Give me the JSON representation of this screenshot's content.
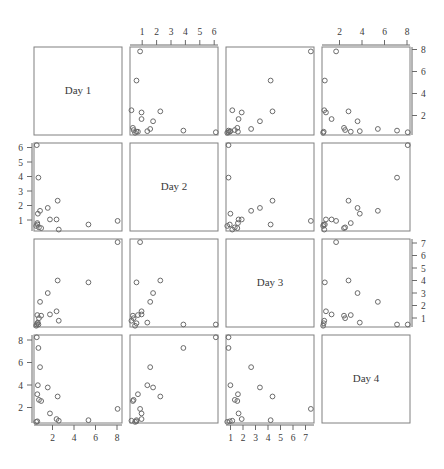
{
  "figure": {
    "title": "",
    "variables": [
      "Day 1",
      "Day 2",
      "Day 3",
      "Day 4"
    ],
    "background_color": "#ffffff",
    "frame_color": "#808080",
    "point_color": "#6b6b6b",
    "text_color": "#3a3a3a"
  },
  "chart_data": {
    "type": "scatter",
    "plot_kind": "scatterplot-matrix",
    "title": "",
    "xlabel": "",
    "ylabel": "",
    "grid": false,
    "legend": null,
    "variables": [
      "Day 1",
      "Day 2",
      "Day 3",
      "Day 4"
    ],
    "axis_ranges": {
      "Day 1": [
        0.3,
        8.3
      ],
      "Day 2": [
        0.5,
        6.6
      ],
      "Day 3": [
        0.6,
        7.6
      ],
      "Day 4": [
        0.5,
        8.3
      ]
    },
    "tick_labels": {
      "Day 1": [
        "2",
        "4",
        "6",
        "8"
      ],
      "Day 2": [
        "1",
        "2",
        "3",
        "4",
        "5",
        "6"
      ],
      "Day 3": [
        "1",
        "2",
        "3",
        "4",
        "5",
        "6",
        "7"
      ],
      "Day 4": [
        "2",
        "4",
        "6",
        "8"
      ]
    },
    "tick_values": {
      "Day 1": [
        2,
        4,
        6,
        8
      ],
      "Day 2": [
        1,
        2,
        3,
        4,
        5,
        6
      ],
      "Day 3": [
        1,
        2,
        3,
        4,
        5,
        6,
        7
      ],
      "Day 4": [
        2,
        4,
        6,
        8
      ]
    },
    "axis_placement": {
      "row_1": "right",
      "row_2": "left",
      "row_3": "right",
      "row_4": "left",
      "col_1": "bottom",
      "col_2": "top",
      "col_3": "bottom",
      "col_4": "top"
    },
    "observations": [
      {
        "Day 1": 0.55,
        "Day 2": 6.45,
        "Day 3": 0.8,
        "Day 4": 8.1
      },
      {
        "Day 1": 0.7,
        "Day 2": 4.2,
        "Day 3": 0.8,
        "Day 4": 7.15
      },
      {
        "Day 1": 0.85,
        "Day 2": 1.9,
        "Day 3": 2.6,
        "Day 4": 5.45
      },
      {
        "Day 1": 0.65,
        "Day 2": 1.7,
        "Day 3": 0.95,
        "Day 4": 3.85
      },
      {
        "Day 1": 1.55,
        "Day 2": 2.1,
        "Day 3": 3.3,
        "Day 4": 3.65
      },
      {
        "Day 1": 0.6,
        "Day 2": 1.05,
        "Day 3": 1.55,
        "Day 4": 3.05
      },
      {
        "Day 1": 0.75,
        "Day 2": 0.75,
        "Day 3": 1.3,
        "Day 4": 2.55
      },
      {
        "Day 1": 0.95,
        "Day 2": 0.7,
        "Day 3": 1.5,
        "Day 4": 2.45
      },
      {
        "Day 1": 2.45,
        "Day 2": 2.6,
        "Day 3": 4.3,
        "Day 4": 2.85
      },
      {
        "Day 1": 1.75,
        "Day 2": 1.3,
        "Day 3": 1.6,
        "Day 4": 1.35
      },
      {
        "Day 1": 2.35,
        "Day 2": 1.3,
        "Day 3": 1.85,
        "Day 4": 0.85
      },
      {
        "Day 1": 2.55,
        "Day 2": 0.6,
        "Day 3": 1.1,
        "Day 4": 0.7
      },
      {
        "Day 1": 5.25,
        "Day 2": 0.95,
        "Day 3": 4.15,
        "Day 4": 0.75
      },
      {
        "Day 1": 7.9,
        "Day 2": 1.2,
        "Day 3": 7.35,
        "Day 4": 1.75
      },
      {
        "Day 1": 0.5,
        "Day 2": 0.85,
        "Day 3": 0.7,
        "Day 4": 0.6
      },
      {
        "Day 1": 0.6,
        "Day 2": 0.95,
        "Day 3": 0.9,
        "Day 4": 0.65
      }
    ]
  },
  "panels": {
    "d11": {
      "label": "Day 1"
    },
    "d22": {
      "label": "Day 2"
    },
    "d33": {
      "label": "Day 3"
    },
    "d44": {
      "label": "Day 4"
    }
  }
}
